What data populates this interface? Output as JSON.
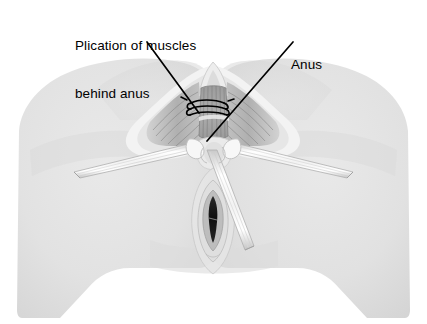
{
  "figure": {
    "kind": "medical-illustration",
    "title_visible": false,
    "view": "perineal surgical view",
    "background_color": "#ffffff",
    "line_color": "#000000",
    "skin_fill": "#e2e2e2",
    "skin_edge": "#d0d0d0",
    "tissue_light": "#f2f2f2",
    "tissue_mid": "#b9b9b9",
    "tissue_dark": "#8a8a8a",
    "muscle_shade": "#9a9a9a",
    "canal_fill": "#a8a8a8",
    "opening_dark": "#1a1a1a",
    "instrument_fill": "#fdfdfd",
    "instrument_edge": "#b5b5b5"
  },
  "labels": [
    {
      "id": "plication",
      "line1": "Plication of muscles",
      "line2": "behind anus",
      "x": 75,
      "y": 6,
      "leader": {
        "x1": 147,
        "y1": 42,
        "x2": 199,
        "y2": 113
      }
    },
    {
      "id": "anus",
      "line1": "Anus",
      "line2": "",
      "x": 291,
      "y": 25,
      "leader": {
        "x1": 293,
        "y1": 42,
        "x2": 207,
        "y2": 141
      }
    }
  ],
  "anatomy": {
    "parts": [
      "left-thigh",
      "right-thigh",
      "buttocks",
      "perineal-body",
      "anal-canal",
      "plicating-sutures",
      "vaginal-introitus",
      "labia",
      "retractor-left",
      "retractor-right",
      "retractor-inferior"
    ],
    "suture_count": 3
  }
}
